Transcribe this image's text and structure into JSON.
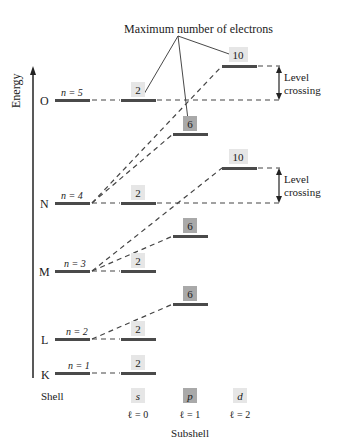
{
  "title": "Maximum number of electrons",
  "axis": {
    "y_label": "Energy",
    "shell_label": "Shell",
    "subshell_label": "Subshell"
  },
  "annotation": {
    "level_crossing_1": "Level",
    "level_crossing_2": "crossing"
  },
  "shells": [
    {
      "letter": "O",
      "n_label": "n = 5"
    },
    {
      "letter": "N",
      "n_label": "n = 4"
    },
    {
      "letter": "M",
      "n_label": "n = 3"
    },
    {
      "letter": "L",
      "n_label": "n = 2"
    },
    {
      "letter": "K",
      "n_label": "n = 1"
    }
  ],
  "capacities": {
    "s": "2",
    "p": "6",
    "d": "10"
  },
  "subshells": [
    {
      "symbol": "s",
      "l_label": "ℓ = 0"
    },
    {
      "symbol": "p",
      "l_label": "ℓ = 1"
    },
    {
      "symbol": "d",
      "l_label": "ℓ = 2"
    }
  ],
  "colors": {
    "level": "#4a4a4a",
    "s_box": "#e6e6e6",
    "p_box": "#a9a9a9",
    "d_box": "#e6e6e6",
    "line": "#333333"
  }
}
